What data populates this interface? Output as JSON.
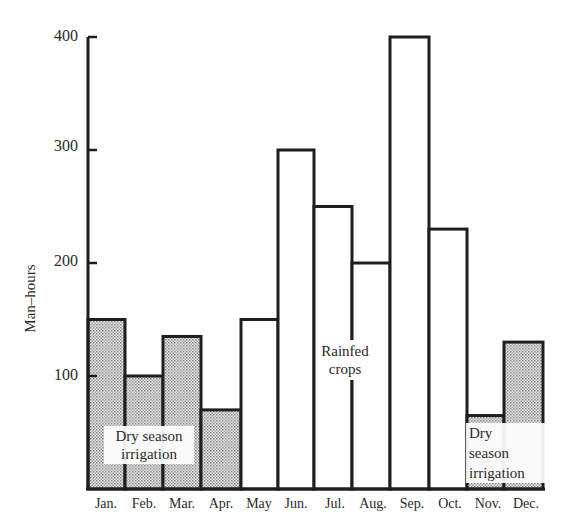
{
  "chart_data": {
    "type": "bar",
    "title": "",
    "xlabel": "",
    "ylabel": "Man-hours",
    "ylim": [
      0,
      400
    ],
    "yticks": [
      100,
      200,
      300,
      400
    ],
    "grid": false,
    "legend": null,
    "categories": [
      "Jan.",
      "Feb.",
      "Mar.",
      "Apr.",
      "May",
      "Jun.",
      "Jul.",
      "Aug.",
      "Sep.",
      "Oct.",
      "Nov.",
      "Dec."
    ],
    "values": [
      150,
      100,
      135,
      70,
      150,
      300,
      250,
      200,
      400,
      230,
      65,
      130
    ],
    "series_groups": [
      {
        "name": "Dry season irrigation",
        "months": [
          "Jan.",
          "Feb.",
          "Mar.",
          "Apr."
        ],
        "fill": "shaded"
      },
      {
        "name": "Rainfed crops",
        "months": [
          "May",
          "Jun.",
          "Jul.",
          "Aug.",
          "Sep.",
          "Oct."
        ],
        "fill": "white"
      },
      {
        "name": "Dry season irrigation",
        "months": [
          "Nov.",
          "Dec."
        ],
        "fill": "shaded"
      }
    ],
    "annotations": [
      {
        "text": "Dry season irrigation",
        "position": "over Jan.-Apr. bars"
      },
      {
        "text": "Rainfed crops",
        "position": "over Jul. bar"
      },
      {
        "text": "Dry season irrigation",
        "position": "over Nov.-Dec. bars"
      }
    ]
  },
  "labels": {
    "ylabel": "Man–hours",
    "yticks": [
      "100",
      "200",
      "300",
      "400"
    ],
    "months": [
      "Jan.",
      "Feb.",
      "Mar.",
      "Apr.",
      "May",
      "Jun.",
      "Jul.",
      "Aug.",
      "Sep.",
      "Oct.",
      "Nov.",
      "Dec."
    ],
    "annot_dry_left_1": "Dry season",
    "annot_dry_left_2": "irrigation",
    "annot_rainfed_1": "Rainfed",
    "annot_rainfed_2": "crops",
    "annot_dry_right_1": "Dry",
    "annot_dry_right_2": "season",
    "annot_dry_right_3": "irrigation"
  },
  "colors": {
    "stroke": "#1e1e1e",
    "shade": "#c8c8c8",
    "background": "#ffffff"
  }
}
